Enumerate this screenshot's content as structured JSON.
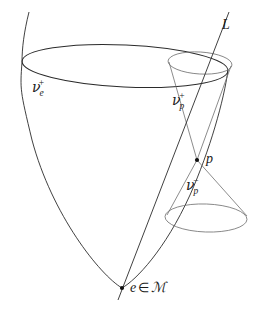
{
  "figure": {
    "type": "lightcone-diagram",
    "background_color": "#ffffff",
    "stroke_color": "#2b2b2b",
    "secondary_stroke_color": "#6e6e6e",
    "labels": {
      "line_L": "L",
      "point_p": "p",
      "apex_statement": {
        "point": "e",
        "membership": "∈",
        "manifold": "ℳ"
      },
      "future_cone_e": {
        "base": "ν",
        "subscript": "e",
        "superscript": "+"
      },
      "future_cone_p": {
        "base": "ν",
        "subscript": "p",
        "superscript": "+"
      },
      "past_cone_p": {
        "base": "ν",
        "subscript": "p",
        "superscript": "−"
      }
    },
    "geometry": {
      "big_cone_apex": [
        122,
        288
      ],
      "big_ellipse_center": [
        125,
        66
      ],
      "big_ellipse_rx": 103,
      "big_ellipse_ry": 21,
      "point_p": [
        197,
        160
      ],
      "small_top_ellipse_center": [
        200,
        63
      ],
      "small_top_ellipse_rx": 32,
      "small_top_ellipse_ry": 11,
      "small_bottom_ellipse_center": [
        206,
        218
      ],
      "small_bottom_ellipse_rx": 41,
      "small_bottom_ellipse_ry": 14,
      "line_L_start": [
        228,
        12
      ],
      "line_L_end": [
        118,
        300
      ]
    }
  }
}
